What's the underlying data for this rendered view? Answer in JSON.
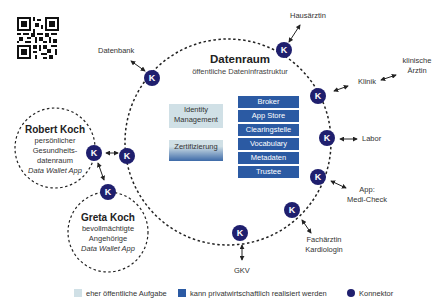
{
  "colors": {
    "connector": "#1f1f6e",
    "public_box": "#d0e0e6",
    "private_box": "#2b5aa3",
    "line": "#222222"
  },
  "qr_code": {
    "icon": "qr-code-icon"
  },
  "datenraum": {
    "title": "Datenraum",
    "subtitle": "öffentliche Dateninfrastruktur"
  },
  "public_services": [
    {
      "label_line1": "Identity",
      "label_line2": "Management"
    },
    {
      "label": "Zertifizierung"
    }
  ],
  "private_services": [
    "Broker",
    "App Store",
    "Clearingstelle",
    "Vocabulary",
    "Metadaten",
    "Trustee"
  ],
  "connector_label": "K",
  "participants": {
    "datenbank": "Datenbank",
    "hausaerztin": "Hausärztin",
    "klinik": "Klinik",
    "klinische_aerztin_line1": "klinische",
    "klinische_aerztin_line2": "Ärztin",
    "labor": "Labor",
    "app_line1": "App:",
    "app_line2": "Medi-Check",
    "fachaerztin_line1": "Fachärztin",
    "fachaerztin_line2": "Kardiologin",
    "gkv": "GKV"
  },
  "robert": {
    "name": "Robert Koch",
    "line1": "persönlicher",
    "line2": "Gesundheits-",
    "line3": "datenraum",
    "app": "Data Wallet App"
  },
  "greta": {
    "name": "Greta Koch",
    "line1": "bevollmächtigte",
    "line2": "Angehörige",
    "app": "Data Wallet App"
  },
  "legend": {
    "public": "eher öffentliche Aufgabe",
    "private": "kann privatwirtschaftlich realisiert werden",
    "connector": "Konnektor"
  }
}
